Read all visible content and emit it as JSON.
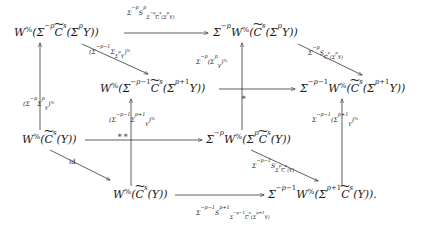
{
  "figure": {
    "kind": "commutative-diagram",
    "background_color": "#ffffff",
    "ink_color": "#1a1a1a"
  },
  "nodes": [
    {
      "id": "n-top-left",
      "name": "node-top-left",
      "latex": "W^{\\%}(\\Sigma^{-p}\\widetilde{C}^{s}(\\Sigma^{p}Y))",
      "plain": "W%(Σ^-p C̃^s(Σ^p Y))",
      "x": 14,
      "y": 27
    },
    {
      "id": "n-top-right",
      "name": "node-top-right",
      "latex": "\\Sigma^{-p}W^{\\%}(\\widetilde{C}^{s}(\\Sigma^{p}Y))",
      "plain": "Σ^-p W%(C̃^s(Σ^p Y))",
      "x": 213,
      "y": 27
    },
    {
      "id": "n-mid-left",
      "name": "node-middle-left",
      "latex": "W^{\\%}(\\Sigma^{-p-1}\\widetilde{C}^{s}(\\Sigma^{p+1}Y))",
      "plain": "W%(Σ^-p-1 C̃^s(Σ^p+1 Y))",
      "x": 100,
      "y": 83
    },
    {
      "id": "n-mid-right",
      "name": "node-middle-right",
      "latex": "\\Sigma^{-p-1}W^{\\%}(\\widetilde{C}^{s}(\\Sigma^{p+1}Y))",
      "plain": "Σ^-p-1 W%(C̃^s(Σ^p+1 Y))",
      "x": 300,
      "y": 83
    },
    {
      "id": "n-low-left",
      "name": "node-lower-left",
      "latex": "W^{\\%}(\\widetilde{C}^{s}(Y))",
      "plain": "W%(C̃^s(Y))",
      "x": 22,
      "y": 134
    },
    {
      "id": "n-low-mid",
      "name": "node-lower-middle",
      "latex": "\\Sigma^{-p}W^{\\%}(\\Sigma^{p}\\widetilde{C}^{s}(Y))",
      "plain": "Σ^-p W%(Σ^p C̃^s(Y))",
      "x": 206,
      "y": 134
    },
    {
      "id": "n-bot-left",
      "name": "node-bottom-left",
      "latex": "W^{\\%}(\\widetilde{C}^{s}(Y))",
      "plain": "W%(C̃^s(Y))",
      "x": 113,
      "y": 189
    },
    {
      "id": "n-bot-right",
      "name": "node-bottom-right",
      "latex": "\\Sigma^{-p-1}W^{\\%}(\\Sigma^{p+1}\\widetilde{C}^{s}(Y))",
      "plain": "Σ^-p-1 W%(Σ^p+1 C̃^s(Y))",
      "x": 268,
      "y": 189
    }
  ],
  "arrow_labels": [
    {
      "id": "lbl-top",
      "name": "arrow-label-top-horizontal",
      "latex": "\\Sigma^{-p}S^{p}_{\\Sigma^{-p}\\widetilde{C}^{s}(\\Sigma^{p}Y)}",
      "plain": "Σ^-p S^p_{Σ^-p C̃^s(Σ^p Y)}",
      "x": 127,
      "y": 10
    },
    {
      "id": "lbl-diag-tl",
      "name": "arrow-label-diagonal-top-left",
      "latex": "(\\Sigma^{-p-1}\\Sigma_{\\Sigma^{p}Y})^{\\%}",
      "plain": "(Σ^-p-1 Σ_{Σ^p Y})%",
      "x": 89,
      "y": 49
    },
    {
      "id": "lbl-diag-tr",
      "name": "arrow-label-diagonal-top-right",
      "latex": "\\Sigma^{-p}S_{\\widetilde{C}^{s}(\\Sigma^{p}Y)}",
      "plain": "Σ^-p S_{C̃^s(Σ^p Y)}",
      "x": 308,
      "y": 50
    },
    {
      "id": "lbl-vert-mid-upper",
      "name": "arrow-label-vertical-middle-upper",
      "latex": "\\Sigma^{-p}(\\Sigma^{p}_{Y})^{\\%}",
      "plain": "Σ^-p(Σ^p_Y)%",
      "x": 196,
      "y": 59
    },
    {
      "id": "lbl-vert-left",
      "name": "arrow-label-vertical-left",
      "latex": "(\\Sigma^{-p}\\Sigma^{p}_{Y})^{\\%}",
      "plain": "(Σ^-p Σ^p_Y)%",
      "x": 23,
      "y": 101
    },
    {
      "id": "lbl-star-single",
      "name": "arrow-label-star-single",
      "latex": "*",
      "plain": "∗",
      "x": 241,
      "y": 94
    },
    {
      "id": "lbl-vert-right",
      "name": "arrow-label-vertical-right",
      "latex": "\\Sigma^{-p-1}(\\Sigma^{p+1}_{Y})^{\\%}",
      "plain": "Σ^-p-1(Σ^p+1_Y)%",
      "x": 312,
      "y": 117
    },
    {
      "id": "lbl-vert-midleft",
      "name": "arrow-label-vertical-middle-left",
      "latex": "(\\Sigma^{-p-1}\\Sigma^{p+1}_{Y})^{\\%}",
      "plain": "(Σ^-p-1 Σ^p+1_Y)%",
      "x": 109,
      "y": 117
    },
    {
      "id": "lbl-star-double",
      "name": "arrow-label-star-double",
      "latex": "**",
      "plain": "∗∗",
      "x": 117,
      "y": 132
    },
    {
      "id": "lbl-id",
      "name": "arrow-label-identity",
      "latex": "\\mathrm{id}",
      "plain": "id",
      "x": 69,
      "y": 159
    },
    {
      "id": "lbl-diag-br",
      "name": "arrow-label-diagonal-bottom-right",
      "latex": "\\Sigma^{-p-1}S_{\\Sigma^{p}\\widetilde{C}^{s}(Y)}",
      "plain": "Σ^-p-1 S_{Σ^p C̃^s(Y)}",
      "x": 252,
      "y": 163
    },
    {
      "id": "lbl-bottom",
      "name": "arrow-label-bottom-horizontal",
      "latex": "\\Sigma^{-p-1}S^{p+1}_{\\Sigma^{-p-1}\\widetilde{C}^{s}(\\Sigma^{p+1}Y)}",
      "plain": "Σ^-p-1 S^p+1_{Σ^-p-1 C̃^s(Σ^p+1 Y)}",
      "x": 196,
      "y": 210
    }
  ],
  "trailing_punctuation": "."
}
